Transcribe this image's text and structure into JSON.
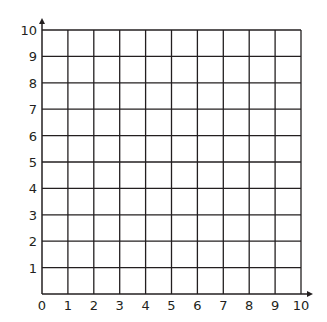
{
  "chart_data": {
    "type": "scatter",
    "title": "",
    "xlabel": "",
    "ylabel": "",
    "xlim": [
      0,
      10
    ],
    "ylim": [
      0,
      10
    ],
    "grid": true,
    "x_ticks": [
      "0",
      "1",
      "2",
      "3",
      "4",
      "5",
      "6",
      "7",
      "8",
      "9",
      "10"
    ],
    "y_ticks": [
      "1",
      "2",
      "3",
      "4",
      "5",
      "6",
      "7",
      "8",
      "9",
      "10"
    ],
    "series": [],
    "colors": {
      "grid": "#231f20",
      "background": "#ffffff"
    }
  }
}
